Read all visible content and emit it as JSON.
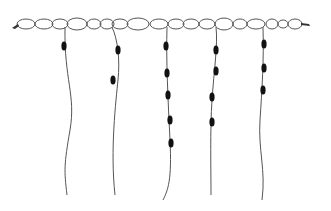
{
  "title": "Knotted cord diagram (quipu-style): chain of oval links with five hanging beaded cords",
  "colors": {
    "line": "#555555",
    "bead": "#111111",
    "background": "#ffffff"
  },
  "chain": {
    "y": 24,
    "links": [
      {
        "cx": 26,
        "rx": 9,
        "ry": 5
      },
      {
        "cx": 44,
        "rx": 9,
        "ry": 5
      },
      {
        "cx": 60,
        "rx": 8,
        "ry": 5
      },
      {
        "cx": 77,
        "rx": 10,
        "ry": 6
      },
      {
        "cx": 94,
        "rx": 7,
        "ry": 5
      },
      {
        "cx": 107,
        "rx": 7,
        "ry": 5
      },
      {
        "cx": 120,
        "rx": 8,
        "ry": 5
      },
      {
        "cx": 138,
        "rx": 11,
        "ry": 6
      },
      {
        "cx": 159,
        "rx": 9,
        "ry": 5
      },
      {
        "cx": 176,
        "rx": 8,
        "ry": 5
      },
      {
        "cx": 191,
        "rx": 8,
        "ry": 5
      },
      {
        "cx": 207,
        "rx": 8,
        "ry": 5
      },
      {
        "cx": 224,
        "rx": 9,
        "ry": 6
      },
      {
        "cx": 240,
        "rx": 7,
        "ry": 5
      },
      {
        "cx": 256,
        "rx": 9,
        "ry": 5
      },
      {
        "cx": 272,
        "rx": 6,
        "ry": 5
      },
      {
        "cx": 283,
        "rx": 5,
        "ry": 4
      },
      {
        "cx": 295,
        "rx": 7,
        "ry": 5
      }
    ],
    "tassel_left": {
      "x": 16,
      "y": 25
    },
    "tassel_right": {
      "x": 303,
      "y": 24
    }
  },
  "cords": [
    {
      "id": 1,
      "path": "M65 27 C 64 80, 76 95, 70 130 S 64 170, 67 195",
      "beads": [
        {
          "x": 64,
          "y": 46
        }
      ]
    },
    {
      "id": 2,
      "path": "M112 27 C 118 40, 120 60, 118 80 S 110 150, 115 195",
      "beads": [
        {
          "x": 118,
          "y": 50
        },
        {
          "x": 113,
          "y": 80
        }
      ]
    },
    {
      "id": 3,
      "path": "M167 27 C 166 60, 168 100, 170 140 S 168 190, 163 200",
      "beads": [
        {
          "x": 166,
          "y": 46
        },
        {
          "x": 167,
          "y": 73
        },
        {
          "x": 168,
          "y": 95
        },
        {
          "x": 170,
          "y": 120
        },
        {
          "x": 171,
          "y": 143
        }
      ]
    },
    {
      "id": 4,
      "path": "M216 27 C 218 45, 214 70, 212 100 S 211 170, 211 195",
      "beads": [
        {
          "x": 216,
          "y": 50
        },
        {
          "x": 216,
          "y": 71
        },
        {
          "x": 212,
          "y": 97
        },
        {
          "x": 212,
          "y": 122
        }
      ]
    },
    {
      "id": 5,
      "path": "M263 27 C 264 60, 262 90, 260 120 S 266 170, 262 200",
      "beads": [
        {
          "x": 264,
          "y": 44
        },
        {
          "x": 264,
          "y": 68
        },
        {
          "x": 263,
          "y": 90
        }
      ]
    }
  ]
}
